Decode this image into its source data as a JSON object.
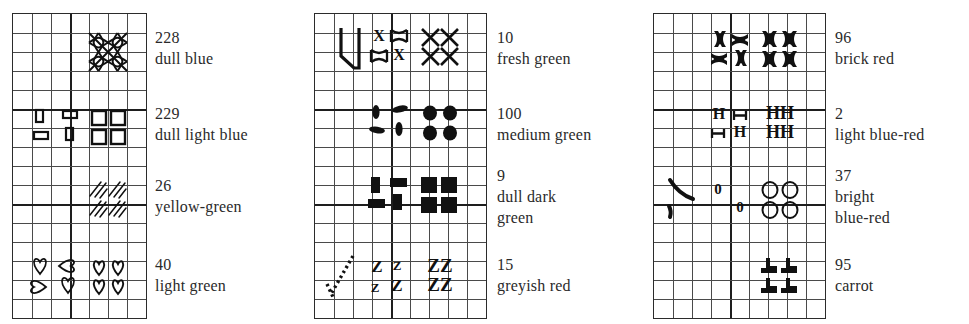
{
  "document": {
    "type": "cross-stitch-symbol-key",
    "title": "Thread colour symbol key",
    "panel_count": 3
  },
  "panels": [
    {
      "id": "panel-1",
      "grid": {
        "cols": 7,
        "rows": 16,
        "cell": 19,
        "x": 12,
        "y": 13,
        "major_cols": [
          0,
          3,
          7
        ],
        "major_rows": [
          0,
          5,
          10,
          16
        ]
      },
      "entries": [
        {
          "number": "228",
          "name": "dull blue",
          "symbol": "lattice-x",
          "block_row": 1
        },
        {
          "number": "229",
          "name": "dull light blue",
          "symbol": "open-square",
          "block_row": 5
        },
        {
          "number": "26",
          "name": "yellow-green",
          "symbol": "hatch-slash",
          "block_row": 9
        },
        {
          "number": "40",
          "name": "light green",
          "symbol": "heart",
          "block_row": 13
        }
      ]
    },
    {
      "id": "panel-2",
      "grid": {
        "cols": 9,
        "rows": 16,
        "cell": 19,
        "x": 314,
        "y": 13,
        "major_cols": [
          0,
          4,
          9
        ],
        "major_rows": [
          0,
          5,
          10,
          16
        ]
      },
      "entries": [
        {
          "number": "10",
          "name": "fresh green",
          "symbol": "x-cross",
          "block_row": 1
        },
        {
          "number": "100",
          "name": "medium green",
          "symbol": "filled-oval",
          "block_row": 5
        },
        {
          "number": "9",
          "name": "dull dark green",
          "symbol": "filled-bar",
          "block_row": 9
        },
        {
          "number": "15",
          "name": "greyish red",
          "symbol": "letter-z",
          "block_row": 13
        }
      ]
    },
    {
      "id": "panel-3",
      "grid": {
        "cols": 9,
        "rows": 16,
        "cell": 19,
        "x": 653,
        "y": 13,
        "major_cols": [
          0,
          4,
          9
        ],
        "major_rows": [
          0,
          5,
          10,
          16
        ]
      },
      "entries": [
        {
          "number": "96",
          "name": "brick red",
          "symbol": "bold-x-flower",
          "block_row": 1
        },
        {
          "number": "2",
          "name": "light blue-red",
          "symbol": "letter-h",
          "block_row": 5
        },
        {
          "number": "37",
          "name": "bright blue-red",
          "symbol": "letter-o",
          "block_row": 9
        },
        {
          "number": "95",
          "name": "carrot",
          "symbol": "filled-tee",
          "block_row": 13
        }
      ]
    }
  ],
  "labels": {
    "p1": [
      {
        "num": "228",
        "lines": [
          "dull blue"
        ]
      },
      {
        "num": "229",
        "lines": [
          "dull light blue"
        ]
      },
      {
        "num": "26",
        "lines": [
          "yellow-green"
        ]
      },
      {
        "num": "40",
        "lines": [
          "light green"
        ]
      }
    ],
    "p2": [
      {
        "num": "10",
        "lines": [
          "fresh green"
        ]
      },
      {
        "num": "100",
        "lines": [
          "medium green"
        ]
      },
      {
        "num": "9",
        "lines": [
          "dull dark",
          "green"
        ]
      },
      {
        "num": "15",
        "lines": [
          "greyish red"
        ]
      }
    ],
    "p3": [
      {
        "num": "96",
        "lines": [
          "brick red"
        ]
      },
      {
        "num": "2",
        "lines": [
          "light blue-red"
        ]
      },
      {
        "num": "37",
        "lines": [
          "bright",
          "blue-red"
        ]
      },
      {
        "num": "95",
        "lines": [
          "carrot"
        ]
      }
    ]
  },
  "colors": {
    "ink": "#1a1a1a",
    "grid_minor": "#4a4a4a",
    "grid_major": "#1e1e1e",
    "paper": "#ffffff"
  }
}
